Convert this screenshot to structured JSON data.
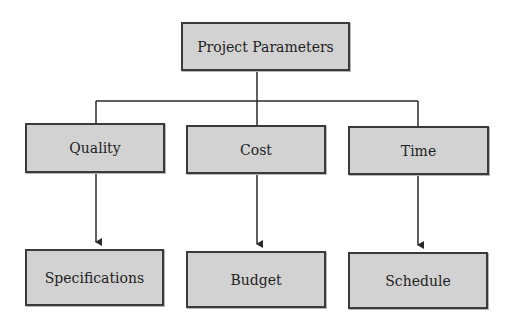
{
  "diagram": {
    "type": "hierarchy",
    "colors": {
      "node_fill": "#d2d2d2",
      "node_border": "#3a3a3a",
      "connector": "#2a2a2a",
      "text": "#222222",
      "background": "#ffffff"
    },
    "root": {
      "id": "root",
      "label": "Project Parameters"
    },
    "parameters": [
      {
        "id": "quality",
        "label": "Quality",
        "child": {
          "id": "specifications",
          "label": "Specifications"
        }
      },
      {
        "id": "cost",
        "label": "Cost",
        "child": {
          "id": "budget",
          "label": "Budget"
        }
      },
      {
        "id": "time",
        "label": "Time",
        "child": {
          "id": "schedule",
          "label": "Schedule"
        }
      }
    ],
    "edges": [
      {
        "from": "root",
        "to": "quality",
        "style": "line"
      },
      {
        "from": "root",
        "to": "cost",
        "style": "line"
      },
      {
        "from": "root",
        "to": "time",
        "style": "line"
      },
      {
        "from": "quality",
        "to": "specifications",
        "style": "arrow"
      },
      {
        "from": "cost",
        "to": "budget",
        "style": "arrow"
      },
      {
        "from": "time",
        "to": "schedule",
        "style": "arrow"
      }
    ]
  }
}
